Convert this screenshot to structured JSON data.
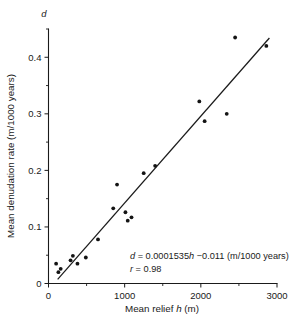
{
  "chart_data": {
    "type": "scatter",
    "title": "",
    "xlabel": "Mean relief h (m)",
    "ylabel": "Mean denudation rate (m/1000 years)",
    "y_axis_symbol": "d",
    "x_symbol": "h",
    "xlim": [
      0,
      3000
    ],
    "ylim": [
      0,
      0.45
    ],
    "grid": false,
    "legend": "none",
    "xticks": [
      0,
      1000,
      2000,
      3000
    ],
    "xtick_labels": [
      "0",
      "1000",
      "2000",
      "3000"
    ],
    "xticks_minor": [
      500,
      1500,
      2500
    ],
    "yticks": [
      0,
      0.1,
      0.2,
      0.3,
      0.4
    ],
    "ytick_labels": [
      "0",
      "0.1",
      "0.2",
      "0.3",
      "0.4"
    ],
    "yticks_minor": [
      0.05,
      0.15,
      0.25,
      0.35,
      0.45
    ],
    "points": [
      {
        "x": 100,
        "y": 0.035
      },
      {
        "x": 130,
        "y": 0.02
      },
      {
        "x": 160,
        "y": 0.026
      },
      {
        "x": 290,
        "y": 0.041
      },
      {
        "x": 320,
        "y": 0.049
      },
      {
        "x": 380,
        "y": 0.035
      },
      {
        "x": 490,
        "y": 0.046
      },
      {
        "x": 650,
        "y": 0.078
      },
      {
        "x": 850,
        "y": 0.133
      },
      {
        "x": 900,
        "y": 0.175
      },
      {
        "x": 1010,
        "y": 0.126
      },
      {
        "x": 1040,
        "y": 0.111
      },
      {
        "x": 1090,
        "y": 0.117
      },
      {
        "x": 1250,
        "y": 0.195
      },
      {
        "x": 1400,
        "y": 0.208
      },
      {
        "x": 1980,
        "y": 0.322
      },
      {
        "x": 2050,
        "y": 0.287
      },
      {
        "x": 2340,
        "y": 0.3
      },
      {
        "x": 2450,
        "y": 0.435
      },
      {
        "x": 2860,
        "y": 0.42
      }
    ],
    "fit": {
      "slope": 0.0001535,
      "intercept": -0.011,
      "x_start": 120,
      "x_end": 2900,
      "equation": "d = 0.0001535h −0.011 (m/1000 years)",
      "correlation": "r = 0.98"
    },
    "series_color": "#141414",
    "line_color": "#1a1a1a"
  },
  "axis": {
    "x_tick_0": "0",
    "x_tick_1": "1000",
    "x_tick_2": "2000",
    "x_tick_3": "3000",
    "y_tick_0": "0",
    "y_tick_1": "0.1",
    "y_tick_2": "0.2",
    "y_tick_3": "0.3",
    "y_tick_4": "0.4",
    "x_title": "Mean relief h (m)",
    "y_title": "Mean denudation rate (m/1000 years)",
    "top_symbol": "d"
  },
  "annotation": {
    "equation": "d = 0.0001535h −0.011 (m/1000 years)",
    "r_value": "r = 0.98"
  }
}
